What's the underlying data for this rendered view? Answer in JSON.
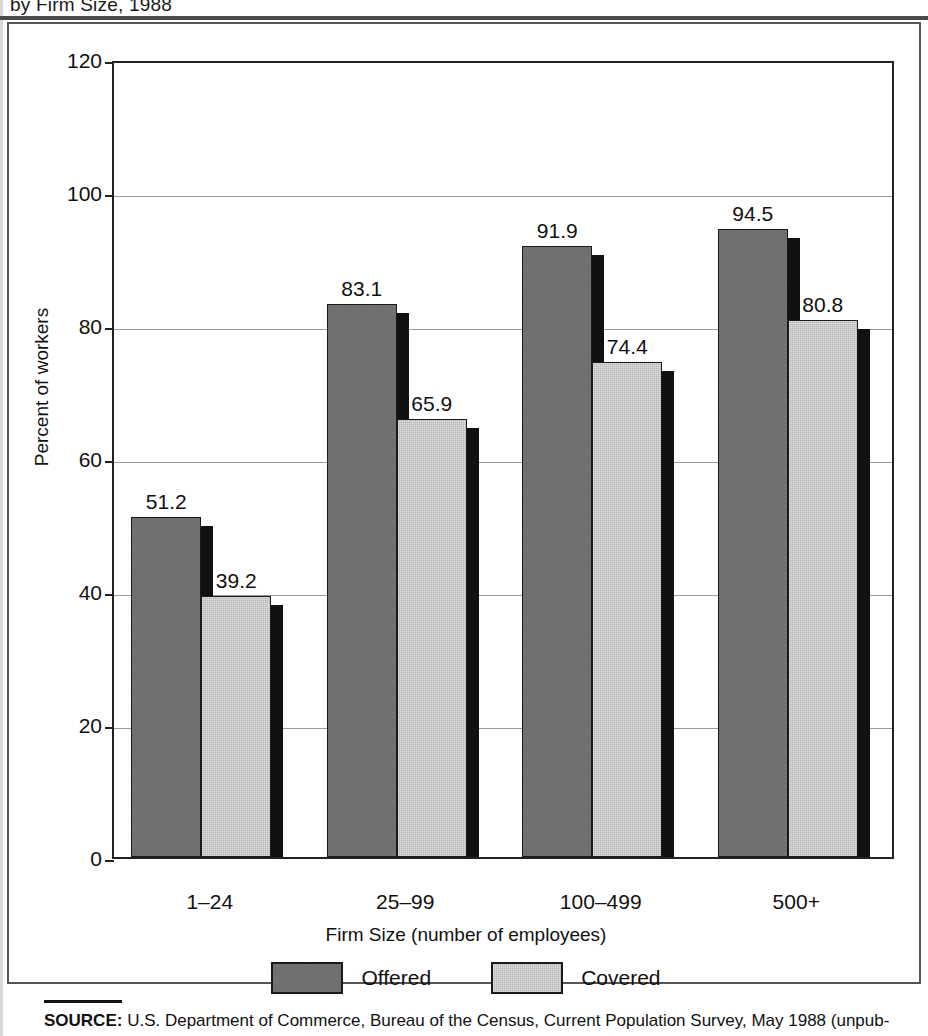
{
  "figure": {
    "title_visible_fragment": "by Firm Size, 1988",
    "source_label": "SOURCE:",
    "source_text": " U.S. Department of Commerce, Bureau of the Census, Current Population Survey, May 1988 (unpub-"
  },
  "chart_data": {
    "type": "bar",
    "title": "by Firm Size, 1988",
    "xlabel": "Firm Size (number of employees)",
    "ylabel": "Percent of workers",
    "categories": [
      "1–24",
      "25–99",
      "100–499",
      "500+"
    ],
    "series": [
      {
        "name": "Offered",
        "color": "#6e6e6e",
        "values": [
          51.2,
          83.1,
          91.9,
          94.5
        ],
        "value_labels": [
          "51.2",
          "83.1",
          "91.9",
          "94.5"
        ]
      },
      {
        "name": "Covered",
        "color": "#b6b6b6",
        "values": [
          39.2,
          65.9,
          74.4,
          80.8
        ],
        "value_labels": [
          "39.2",
          "65.9",
          "74.4",
          "80.8"
        ]
      }
    ],
    "ylim": [
      0,
      120
    ],
    "yticks": [
      0,
      20,
      40,
      60,
      80,
      100,
      120
    ],
    "ytick_labels": [
      "0",
      "20",
      "40",
      "60",
      "80",
      "100",
      "120"
    ],
    "grid": true,
    "legend_position": "bottom"
  },
  "legend": {
    "items": [
      {
        "label": "Offered",
        "swatch": "offered"
      },
      {
        "label": "Covered",
        "swatch": "covered"
      }
    ]
  }
}
